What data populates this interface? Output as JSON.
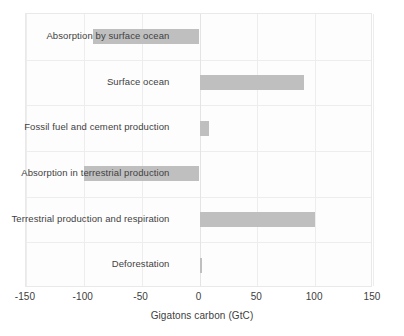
{
  "chart_data": {
    "type": "bar",
    "orientation": "horizontal",
    "title": "",
    "xlabel": "Gigatons carbon (GtC)",
    "ylabel": "",
    "xlim": [
      -150,
      150
    ],
    "xticks": [
      -150,
      -100,
      -50,
      0,
      50,
      100,
      150
    ],
    "xtick_labels": [
      "-150",
      "-100",
      "-50",
      "0",
      "50",
      "100",
      "150"
    ],
    "grid": true,
    "legend": false,
    "bar_color": "#bfbfbf",
    "categories": [
      "Absorption by surface ocean",
      "Surface ocean",
      "Fossil fuel and cement production",
      "Absorption in terrestrial production",
      "Terrestrial production and respiration",
      "Deforestation"
    ],
    "values": [
      -92,
      90,
      8,
      -100,
      100,
      2
    ]
  },
  "axis": {
    "x_title": "Gigatons carbon (GtC)"
  }
}
